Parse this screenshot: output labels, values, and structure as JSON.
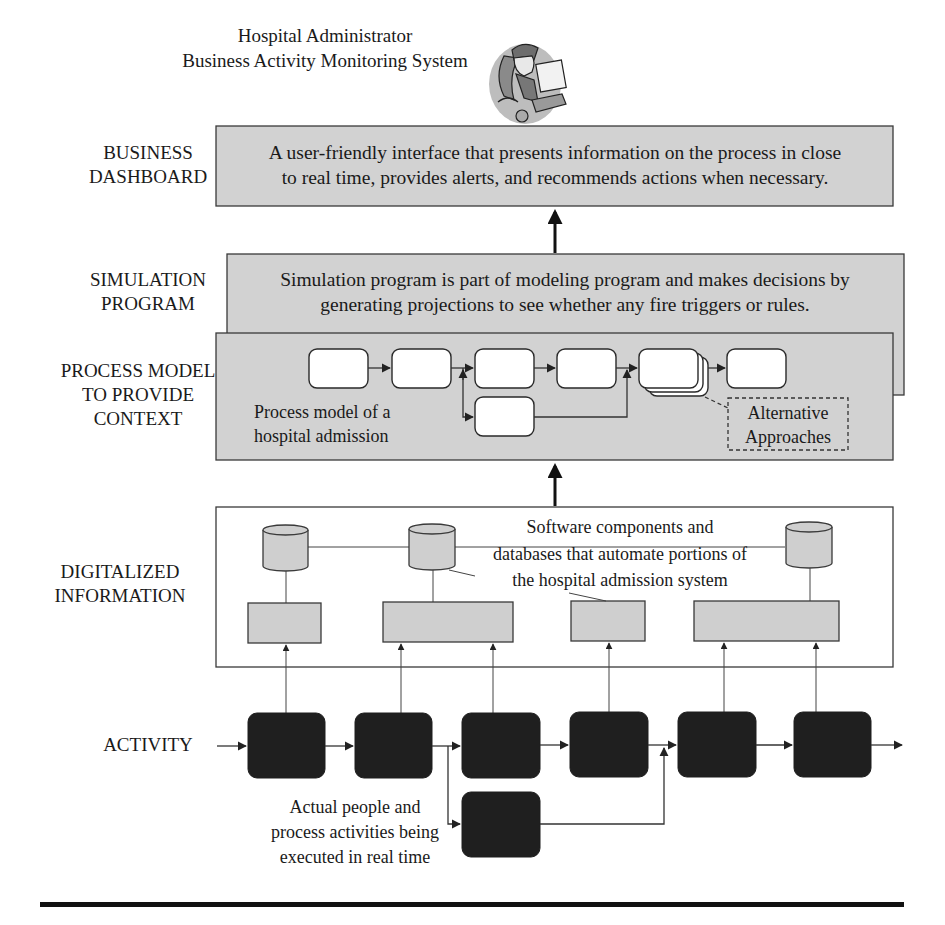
{
  "header": {
    "title_line1": "Hospital Administrator",
    "title_line2": "Business Activity Monitoring System",
    "illustration": "administrator-at-computer-icon"
  },
  "layers": {
    "dashboard": {
      "label_line1": "BUSINESS",
      "label_line2": "DASHBOARD",
      "text_line1": "A user-friendly interface that presents information on the process in close",
      "text_line2": "to real time, provides alerts, and recommends actions when necessary."
    },
    "simulation": {
      "label_line1": "SIMULATION",
      "label_line2": "PROGRAM",
      "text_line1": "Simulation program is part of modeling program and makes decisions by",
      "text_line2": "generating projections to see whether any fire triggers or rules."
    },
    "process_model": {
      "label_line1": "PROCESS MODEL",
      "label_line2": "TO PROVIDE",
      "label_line3": "CONTEXT",
      "caption_line1": "Process model of a",
      "caption_line2": "hospital admission",
      "callout_line1": "Alternative",
      "callout_line2": "Approaches",
      "step_count": 7
    },
    "digitalized": {
      "label_line1": "DIGITALIZED",
      "label_line2": "INFORMATION",
      "caption_line1": "Software components and",
      "caption_line2": "databases that automate portions of",
      "caption_line3": "the hospital admission system",
      "database_count": 3,
      "component_count": 4
    },
    "activity": {
      "label": "ACTIVITY",
      "caption_line1": "Actual people and",
      "caption_line2": "process activities being",
      "caption_line3": "executed in real time",
      "step_count": 7
    }
  },
  "colors": {
    "box_fill": "#d2d2d2",
    "activity_fill": "#1f1f1f",
    "stroke": "#3a3a3a"
  }
}
